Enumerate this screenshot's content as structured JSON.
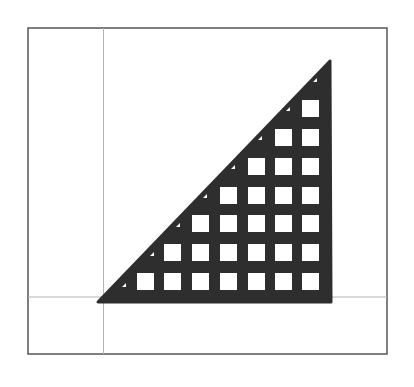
{
  "figure": {
    "colors": {
      "background": "#ffffff",
      "frame": "#555555",
      "axes": "#b4b4b4",
      "shape_fill": "#2e2e2e",
      "holes": "#ffffff"
    },
    "frame": {
      "x": 28,
      "y": 28,
      "width": 359,
      "height": 326
    },
    "axes": {
      "x_axis_y": 297,
      "y_axis_x": 103.5
    },
    "triangle": {
      "points": [
        [
          98,
          302
        ],
        [
          331,
          302
        ],
        [
          330,
          61
        ]
      ]
    },
    "grid": {
      "rows": 7,
      "cols": 7,
      "col_x": [
        137,
        164,
        192,
        220,
        248,
        275,
        302
      ],
      "row_y": [
        100,
        129,
        158,
        187,
        215,
        244,
        273
      ],
      "hole_size": 17,
      "rule": "row r (0 = top) contains holes in the rightmost r+1 columns"
    },
    "notches": [
      [
        313,
        82
      ],
      [
        286,
        111
      ],
      [
        258,
        140
      ],
      [
        231,
        169
      ],
      [
        203,
        198
      ],
      [
        176,
        227
      ],
      [
        150,
        256
      ],
      [
        122,
        287
      ]
    ]
  }
}
